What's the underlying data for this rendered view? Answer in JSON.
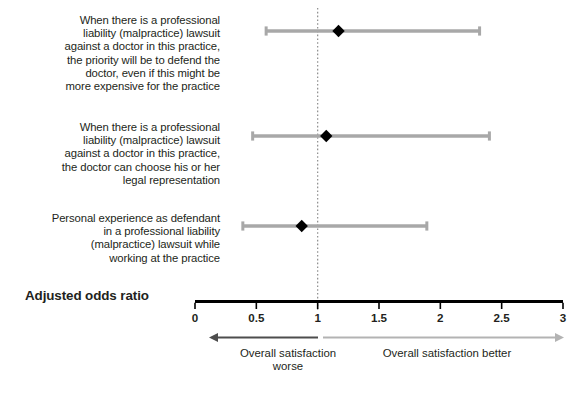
{
  "figure": {
    "axis_title": "Adjusted odds ratio",
    "annotation_left": "Overall satisfaction worse",
    "annotation_right": "Overall satisfaction better"
  },
  "chart_data": {
    "type": "scatter",
    "subtype": "forest-plot",
    "title": "",
    "xlabel": "Adjusted odds ratio",
    "ylabel": "",
    "xlim": [
      0,
      3
    ],
    "xticks": [
      0,
      0.5,
      1,
      1.5,
      2,
      2.5,
      3
    ],
    "xticklabels": [
      "0",
      "0.5",
      "1",
      "1.5",
      "2",
      "2.5",
      "3"
    ],
    "grid": false,
    "legend": "none",
    "reference_line": {
      "value": 1,
      "style": "dotted",
      "color": "#8c8c8c"
    },
    "colors": {
      "marker": "#000000",
      "interval": "#a8a8a8",
      "axis": "#000000",
      "arrow_left": "#4d4d4d",
      "arrow_right": "#b3b3b3"
    },
    "categories": [
      "When there is a professional liability (malpractice) lawsuit against a doctor in this practice, the priority will be to defend the doctor, even if this might be more expensive for the practice",
      "When there is a professional liability (malpractice) lawsuit against a doctor in this practice, the doctor can choose his or her legal representation",
      "Personal experience as defendant in a professional liability (malpractice) lawsuit while working at the practice"
    ],
    "points": [
      {
        "label_lines": [
          "When there is a professional",
          "liability (malpractice) lawsuit",
          "against a doctor in this practice,",
          "the priority will be to defend the",
          "doctor, even if this might be",
          "more expensive for the practice"
        ],
        "odds_ratio": 1.17,
        "ci_low": 0.58,
        "ci_high": 2.32
      },
      {
        "label_lines": [
          "When there is a professional",
          "liability (malpractice) lawsuit",
          "against a doctor in this practice,",
          "the doctor can choose his or her",
          "legal representation"
        ],
        "odds_ratio": 1.07,
        "ci_low": 0.47,
        "ci_high": 2.4
      },
      {
        "label_lines": [
          "Personal experience as defendant",
          "in a professional liability",
          "(malpractice) lawsuit while",
          "working at the practice"
        ],
        "odds_ratio": 0.87,
        "ci_low": 0.39,
        "ci_high": 1.89
      }
    ],
    "annotations": [
      {
        "text": "Overall satisfaction worse",
        "direction": "left"
      },
      {
        "text": "Overall satisfaction better",
        "direction": "right"
      }
    ]
  }
}
